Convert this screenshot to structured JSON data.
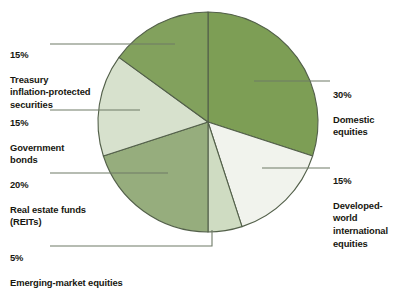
{
  "chart_data": {
    "type": "pie",
    "title": "",
    "subtitle": "",
    "xlabel": "",
    "ylabel": "",
    "legend_position": "callouts",
    "grid": false,
    "start_angle_deg": 0,
    "direction": "clockwise",
    "center": [
      208,
      122
    ],
    "radius": 110,
    "categories": [
      "Domestic equities",
      "Developed-world international equities",
      "Emerging-market equities",
      "Real estate funds (REITs)",
      "Government bonds",
      "Treasury inflation-protected securities"
    ],
    "values": [
      30,
      15,
      5,
      20,
      15,
      15
    ],
    "value_labels": [
      "30%",
      "15%",
      "5%",
      "20%",
      "15%",
      "15%"
    ],
    "colors": [
      "#7d9e55",
      "#f1f3ed",
      "#cfdcc2",
      "#96ad7d",
      "#d7e1cd",
      "#82a15d"
    ],
    "stroke_color": "#53604a",
    "units": "percent"
  },
  "callouts": {
    "tips": {
      "percent": "15%",
      "description": "Treasury\ninflation-protected\nsecurities"
    },
    "government_bonds": {
      "percent": "15%",
      "description": "Government\nbonds"
    },
    "real_estate": {
      "percent": "20%",
      "description": "Real estate funds\n(REITs)"
    },
    "emerging_market": {
      "percent": "5%",
      "description": "Emerging-market equities"
    },
    "domestic": {
      "percent": "30%",
      "description": "Domestic\nequities"
    },
    "developed_world": {
      "percent": "15%",
      "description": "Developed-\nworld\ninternational\nequities"
    }
  },
  "style": {
    "background": "#ffffff",
    "leader_line_color": "#6e7a66",
    "text_color": "#17170f"
  }
}
